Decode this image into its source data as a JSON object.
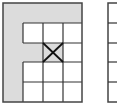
{
  "figure": {
    "colors": {
      "shade": "#dcdcdc",
      "line": "#333333",
      "background": "#ffffff"
    },
    "left_grid": {
      "x": 3,
      "y": 3,
      "width": 79,
      "height": 99,
      "col_lines": [
        23,
        43,
        63,
        82
      ],
      "row_lines": [
        23,
        43,
        62,
        82,
        102
      ],
      "shaded_regions": [
        {
          "name": "top-band",
          "x": 3,
          "y": 3,
          "w": 79,
          "h": 20
        },
        {
          "name": "left-band",
          "x": 3,
          "y": 3,
          "w": 20,
          "h": 99
        },
        {
          "name": "middle-arm",
          "x": 23,
          "y": 43,
          "w": 40,
          "h": 19
        }
      ],
      "crossed_cell": {
        "x": 43,
        "y": 43,
        "w": 20,
        "h": 19
      }
    },
    "right_grid": {
      "x": 108,
      "y": 3,
      "height": 99,
      "row_lines": [
        23,
        43,
        62,
        82
      ]
    }
  }
}
